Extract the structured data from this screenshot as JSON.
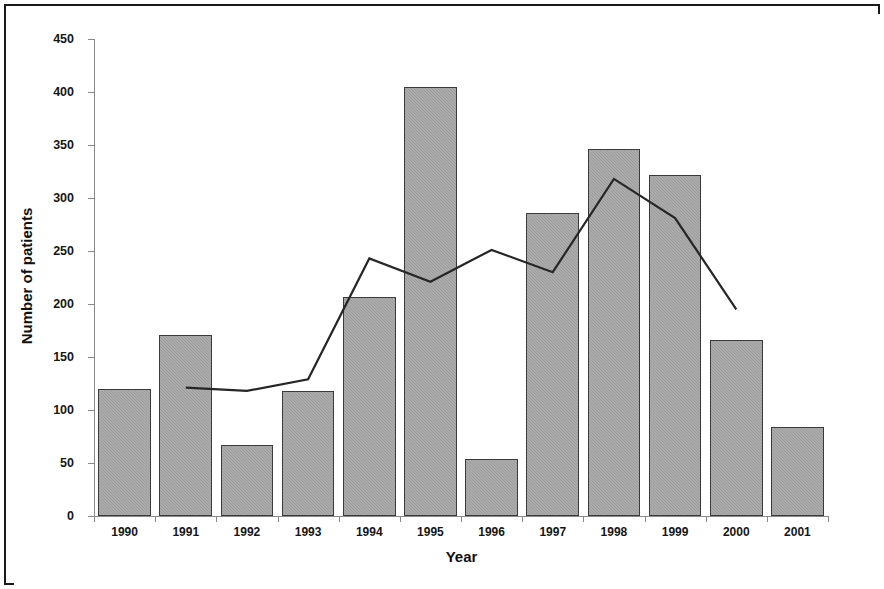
{
  "chart_data": {
    "type": "bar",
    "title": "",
    "xlabel": "Year",
    "ylabel": "Number of patients",
    "categories": [
      "1990",
      "1991",
      "1992",
      "1993",
      "1994",
      "1995",
      "1996",
      "1997",
      "1998",
      "1999",
      "2000",
      "2001"
    ],
    "ylim": [
      0,
      450
    ],
    "yticks": [
      0,
      50,
      100,
      150,
      200,
      250,
      300,
      350,
      400,
      450
    ],
    "ytick_labels": [
      "0",
      "50",
      "100",
      "150",
      "200",
      "250",
      "300",
      "350",
      "400",
      "450"
    ],
    "grid": false,
    "legend": "none",
    "series": [
      {
        "name": "Number of patients",
        "render": "bar",
        "color": "#9b9b9b",
        "edge_color": "#3a3a3a",
        "values": [
          120,
          171,
          67,
          118,
          207,
          405,
          54,
          286,
          346,
          322,
          166,
          84
        ]
      },
      {
        "name": "Trend line",
        "render": "line",
        "color": "#262626",
        "x": [
          "1991",
          "1992",
          "1993",
          "1994",
          "1995",
          "1996",
          "1997",
          "1998",
          "1999",
          "2000"
        ],
        "values": [
          121,
          118,
          129,
          243,
          221,
          251,
          230,
          318,
          281,
          195
        ]
      }
    ]
  },
  "figure": {
    "border_color": "#1a1a1a",
    "background": "#ffffff"
  }
}
